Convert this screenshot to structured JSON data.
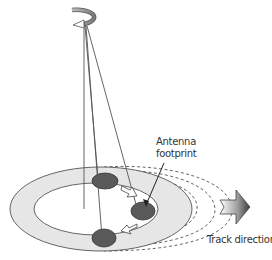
{
  "diagram": {
    "labels": {
      "antenna_footprint_line1": "Antenna",
      "antenna_footprint_line2": "footprint",
      "track_direction": "Track direction"
    },
    "elements": {
      "rotation_icon": "rotating-arrow-icon",
      "track_arrow": "track-direction-arrow-icon",
      "footprints": 3,
      "motion_arrows": 2
    },
    "colors": {
      "ring_fill": "#e6e6e6",
      "footprint_fill": "#5a5a5a",
      "line": "#555555"
    }
  }
}
